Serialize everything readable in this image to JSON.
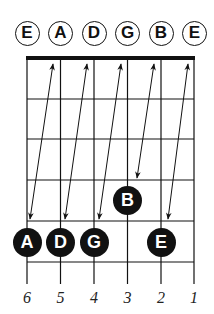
{
  "open_strings": [
    {
      "string": 6,
      "note": "E"
    },
    {
      "string": 5,
      "note": "A"
    },
    {
      "string": 4,
      "note": "D"
    },
    {
      "string": 3,
      "note": "G"
    },
    {
      "string": 2,
      "note": "B"
    },
    {
      "string": 1,
      "note": "E"
    }
  ],
  "fretted_notes": [
    {
      "string": 6,
      "fret": 5,
      "note": "A"
    },
    {
      "string": 5,
      "fret": 5,
      "note": "D"
    },
    {
      "string": 4,
      "fret": 5,
      "note": "G"
    },
    {
      "string": 3,
      "fret": 4,
      "note": "B"
    },
    {
      "string": 2,
      "fret": 5,
      "note": "E"
    }
  ],
  "string_numbers": [
    "6",
    "5",
    "4",
    "3",
    "2",
    "1"
  ],
  "colors": {
    "ink": "#111111",
    "background": "#ffffff"
  }
}
